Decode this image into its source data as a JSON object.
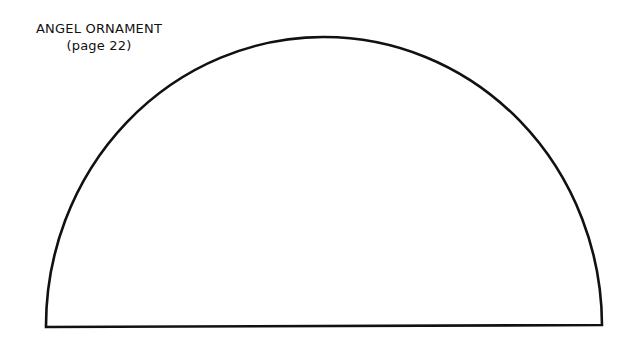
{
  "pattern": {
    "title": "ANGEL ORNAMENT",
    "page_ref": "(page 22)",
    "shape": "semicircle",
    "stroke_color": "#111111",
    "background_color": "#ffffff"
  }
}
